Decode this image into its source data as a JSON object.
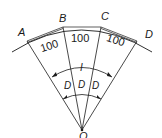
{
  "diagram": {
    "points": {
      "A": "A",
      "B": "B",
      "C": "C",
      "D": "D",
      "O": "O"
    },
    "segments": [
      {
        "from": "A",
        "to": "B",
        "length": "100"
      },
      {
        "from": "B",
        "to": "C",
        "length": "100"
      },
      {
        "from": "C",
        "to": "D",
        "length": "100"
      }
    ],
    "angle_labels": {
      "total": "I",
      "sub": [
        "D",
        "D",
        "D"
      ]
    },
    "colors": {
      "line": "#1a1a1a",
      "background": "#ffffff"
    }
  }
}
